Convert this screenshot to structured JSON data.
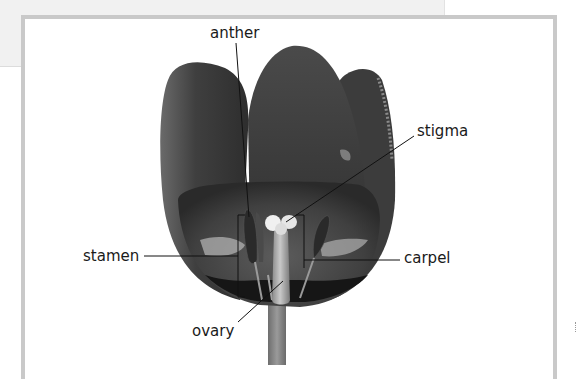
{
  "diagram": {
    "labels": {
      "anther": "anther",
      "stigma": "stigma",
      "stamen": "stamen",
      "carpel": "carpel",
      "ovary": "ovary"
    },
    "colors": {
      "frame_border": "#c9c9c9",
      "background_card": "#f1f1f1",
      "petal_dark": "#3a3a3a",
      "petal_mid": "#555555",
      "label_text": "#1a1a1a",
      "leader_line": "#111111"
    }
  }
}
